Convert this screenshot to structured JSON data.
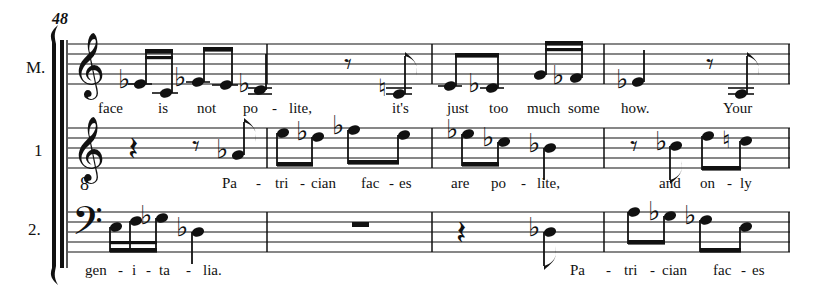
{
  "document": {
    "kind": "music-score-excerpt",
    "width": 820,
    "height": 293,
    "ink_color": "#111111",
    "paper_color": "#ffffff"
  },
  "rehearsal_mark": "48",
  "systems": [
    {
      "id": "staff-m",
      "label": "M.",
      "clef": "treble",
      "lyrics": "face       is       not    po   -   lite,                   it's      just   too   much some       how.                 Your"
    },
    {
      "id": "staff-1",
      "label": "1",
      "clef": "treble-8",
      "lyrics": "Pa   -   tri - cian   fac - es          are   po   -   lite,                     and   on  -  ly"
    },
    {
      "id": "staff-2",
      "label": "2.",
      "clef": "bass",
      "lyrics": "gen - i - ta  -  lia.                                                        Pa   -   tri - cian   fac - es"
    }
  ],
  "lyric_syllables": {
    "staff_m": [
      {
        "text": "face",
        "x": 98
      },
      {
        "text": "is",
        "x": 158
      },
      {
        "text": "not",
        "x": 197
      },
      {
        "text": "po",
        "x": 243
      },
      {
        "text": "-",
        "x": 272
      },
      {
        "text": "lite,",
        "x": 289
      },
      {
        "text": "it's",
        "x": 392
      },
      {
        "text": "just",
        "x": 447
      },
      {
        "text": "too",
        "x": 489
      },
      {
        "text": "much",
        "x": 527
      },
      {
        "text": "some",
        "x": 568
      },
      {
        "text": "how.",
        "x": 621
      },
      {
        "text": "Your",
        "x": 723
      }
    ],
    "staff_1": [
      {
        "text": "Pa",
        "x": 222
      },
      {
        "text": "-",
        "x": 256
      },
      {
        "text": "tri",
        "x": 275
      },
      {
        "text": "-",
        "x": 300
      },
      {
        "text": "cian",
        "x": 311
      },
      {
        "text": "fac",
        "x": 361
      },
      {
        "text": "-",
        "x": 389
      },
      {
        "text": "es",
        "x": 399
      },
      {
        "text": "are",
        "x": 451
      },
      {
        "text": "po",
        "x": 491
      },
      {
        "text": "-",
        "x": 521
      },
      {
        "text": "lite,",
        "x": 537
      },
      {
        "text": "and",
        "x": 659
      },
      {
        "text": "on",
        "x": 700
      },
      {
        "text": "-",
        "x": 727
      },
      {
        "text": "ly",
        "x": 740
      }
    ],
    "staff_2": [
      {
        "text": "gen",
        "x": 85
      },
      {
        "text": "-",
        "x": 118
      },
      {
        "text": "i",
        "x": 132
      },
      {
        "text": "-",
        "x": 146
      },
      {
        "text": "ta",
        "x": 159
      },
      {
        "text": "-",
        "x": 186
      },
      {
        "text": "lia.",
        "x": 203
      },
      {
        "text": "Pa",
        "x": 570
      },
      {
        "text": "-",
        "x": 606
      },
      {
        "text": "tri",
        "x": 624
      },
      {
        "text": "-",
        "x": 650
      },
      {
        "text": "cian",
        "x": 662
      },
      {
        "text": "fac",
        "x": 713
      },
      {
        "text": "-",
        "x": 741
      },
      {
        "text": "es",
        "x": 752
      }
    ]
  },
  "measures": {
    "barline_x": [
      267,
      432,
      604,
      790
    ],
    "count": 4
  },
  "notation_summary": {
    "staff_m_events": "flat eighth, eighth (beamed) / flat eighth, eighth (beamed) / flat quarter | eighth rest, natural eighth | eighth, flat eighth beamed, eighth, flat eighth beamed | flat quarter, quarter, eighth rest, eighth",
    "staff_1_events": "quarter rest, eighth rest, flat eighth | eighth, flat eighth beamed, flat eighth, eighth beamed | flat eighth, flat eighth beamed, flat quarter | eighth rest, flat eighth, eighth, natural eighth beamed",
    "staff_2_events": "eighth, eighth, flat eighth beamed, flat quarter | whole rest | quarter rest, flat eighth | eighth, flat eighth beamed, flat eighth, eighth beamed"
  }
}
